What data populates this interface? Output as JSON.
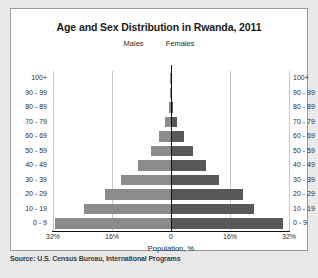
{
  "source_note": "Source: U.S. Census Bureau, International Programs",
  "chart_data": {
    "type": "bar",
    "subtype": "population-pyramid",
    "title": "Age and Sex Distribution in Rwanda, 2011",
    "xlabel": "Population, %",
    "ylabel": "",
    "grid": true,
    "legend_position": "above-center",
    "xlim": [
      -32,
      32
    ],
    "xticks": [
      -32,
      -16,
      0,
      16,
      32
    ],
    "xtick_labels": [
      "32%",
      "16%",
      "0",
      "16%",
      "32%"
    ],
    "categories": [
      "0 - 9",
      "10 - 19",
      "20 - 29",
      "30 - 39",
      "40 - 49",
      "50 - 59",
      "60 - 69",
      "70 - 79",
      "80 - 89",
      "90 - 99",
      "100+"
    ],
    "series": [
      {
        "name": "Males",
        "color": "#8b8b8b",
        "values": [
          31.5,
          23.5,
          18.0,
          13.5,
          9.0,
          5.5,
          3.2,
          1.6,
          0.5,
          0.15,
          0.05
        ]
      },
      {
        "name": "Females",
        "color": "#585858",
        "values": [
          30.5,
          22.5,
          19.5,
          13.0,
          9.5,
          6.0,
          3.4,
          1.7,
          0.6,
          0.2,
          0.05
        ]
      }
    ],
    "annotations": [
      "Males",
      "Females"
    ]
  },
  "axis_labels_left": [
    "100+",
    "90 - 99",
    "80 - 89",
    "70 - 79",
    "60 - 69",
    "50 - 59",
    "40 - 49",
    "30 - 39",
    "20 - 29",
    "10 - 19",
    "0 - 9"
  ],
  "axis_labels_right": [
    "100+",
    "90 - 99",
    "80 - 89",
    "70 - 79",
    "60 - 69",
    "50 - 59",
    "40 - 49",
    "30 - 39",
    "20 - 29",
    "10 - 19",
    "0 - 9"
  ]
}
